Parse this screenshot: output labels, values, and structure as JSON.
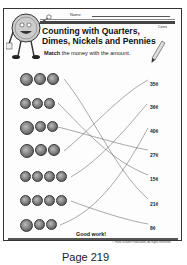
{
  "header": {
    "name_label": "Name",
    "coins_tag": "Coins",
    "title_line1": "Counting with Quarters,",
    "title_line2": "Dimes, Nickels and Pennies",
    "instruction_bold": "Match",
    "instruction_rest": " the money with the amount."
  },
  "coin_rows": [
    {
      "count": 3,
      "sizes": [
        13,
        12,
        12
      ],
      "y": 73
    },
    {
      "count": 3,
      "sizes": [
        11,
        11,
        11
      ],
      "y": 98
    },
    {
      "count": 3,
      "sizes": [
        14,
        11,
        11
      ],
      "y": 121
    },
    {
      "count": 3,
      "sizes": [
        14,
        12,
        12
      ],
      "y": 144
    },
    {
      "count": 4,
      "sizes": [
        11,
        11,
        11,
        11
      ],
      "y": 171
    },
    {
      "count": 4,
      "sizes": [
        11,
        11,
        11,
        11
      ],
      "y": 195
    },
    {
      "count": 3,
      "sizes": [
        13,
        11,
        11
      ],
      "y": 219
    }
  ],
  "amounts": [
    {
      "label": "35¢",
      "y": 81
    },
    {
      "label": "36¢",
      "y": 104
    },
    {
      "label": "40¢",
      "y": 128
    },
    {
      "label": "27¢",
      "y": 152
    },
    {
      "label": "15¢",
      "y": 176
    },
    {
      "label": "21¢",
      "y": 201
    },
    {
      "label": "8¢",
      "y": 225
    }
  ],
  "footer": {
    "good_work": "Good work!",
    "copyright": "© Frank Schaffer Publications, All Rights Reserved",
    "page_label": "Page 219"
  }
}
